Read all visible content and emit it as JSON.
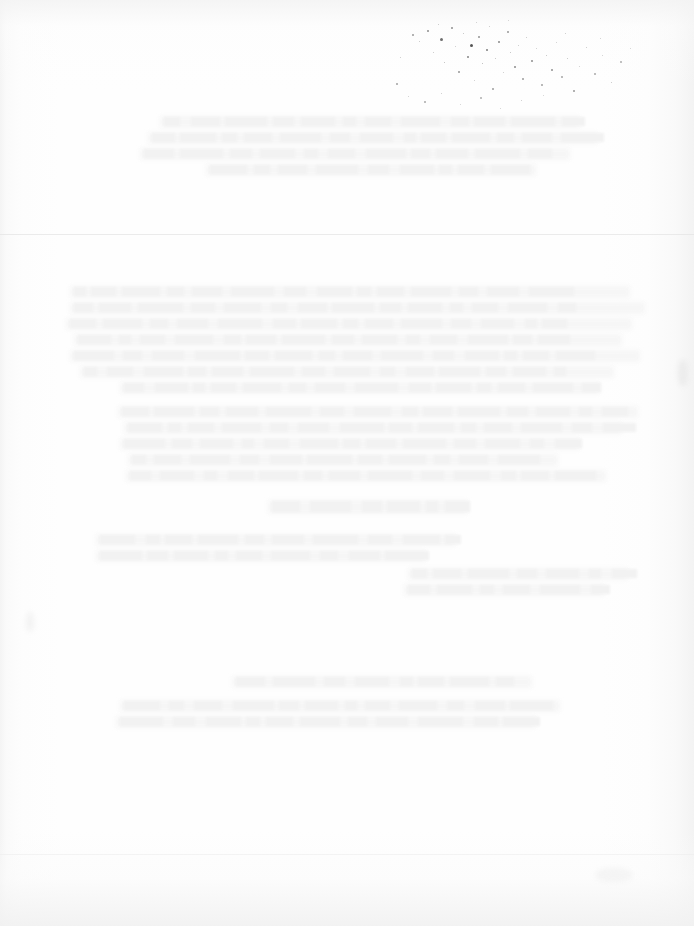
{
  "document": {
    "kind": "scanned-page",
    "page_state": "blank",
    "visible_text": "",
    "width_px": 694,
    "height_px": 926,
    "notes_visible_on_page": "No legible text, headings, figures, tables or UI controls are rendered on this page."
  },
  "appearance": {
    "paper_color": "#fefefe",
    "paper_edge_shadow_color": "#f3f3f3",
    "ghost_text_color": "#f5f5f5",
    "speck_color_dark": "#555555",
    "speck_color_mid": "#888888",
    "speck_color_light": "#bbbbbb",
    "seam_color": "#e4e4e4"
  },
  "artifacts": {
    "speck_cluster_label": "toner-speckle-cluster",
    "ghost_text_label": "bleed-through-ghost-text",
    "seam_label": "scan-seam-line",
    "gutter_label": "scan-gutter-shading"
  },
  "specks": [
    {
      "x": 412,
      "y": 34,
      "d": 2,
      "c": "#9a9a9a"
    },
    {
      "x": 419,
      "y": 41,
      "d": 1,
      "c": "#bdbdbd"
    },
    {
      "x": 427,
      "y": 30,
      "d": 2,
      "c": "#8c8c8c"
    },
    {
      "x": 433,
      "y": 52,
      "d": 1,
      "c": "#c0c0c0"
    },
    {
      "x": 440,
      "y": 38,
      "d": 3,
      "c": "#6f6f6f"
    },
    {
      "x": 444,
      "y": 62,
      "d": 1,
      "c": "#b4b4b4"
    },
    {
      "x": 451,
      "y": 27,
      "d": 2,
      "c": "#8f8f8f"
    },
    {
      "x": 455,
      "y": 46,
      "d": 1,
      "c": "#c3c3c3"
    },
    {
      "x": 458,
      "y": 71,
      "d": 2,
      "c": "#969696"
    },
    {
      "x": 463,
      "y": 33,
      "d": 1,
      "c": "#b9b9b9"
    },
    {
      "x": 467,
      "y": 56,
      "d": 2,
      "c": "#858585"
    },
    {
      "x": 470,
      "y": 44,
      "d": 3,
      "c": "#555555"
    },
    {
      "x": 474,
      "y": 80,
      "d": 1,
      "c": "#c6c6c6"
    },
    {
      "x": 478,
      "y": 36,
      "d": 2,
      "c": "#929292"
    },
    {
      "x": 482,
      "y": 63,
      "d": 1,
      "c": "#b0b0b0"
    },
    {
      "x": 486,
      "y": 49,
      "d": 2,
      "c": "#7d7d7d"
    },
    {
      "x": 489,
      "y": 26,
      "d": 1,
      "c": "#c1c1c1"
    },
    {
      "x": 492,
      "y": 88,
      "d": 2,
      "c": "#9d9d9d"
    },
    {
      "x": 495,
      "y": 58,
      "d": 1,
      "c": "#bbbbbb"
    },
    {
      "x": 498,
      "y": 41,
      "d": 2,
      "c": "#888888"
    },
    {
      "x": 503,
      "y": 72,
      "d": 1,
      "c": "#c4c4c4"
    },
    {
      "x": 507,
      "y": 31,
      "d": 2,
      "c": "#979797"
    },
    {
      "x": 510,
      "y": 52,
      "d": 1,
      "c": "#b6b6b6"
    },
    {
      "x": 514,
      "y": 66,
      "d": 2,
      "c": "#8b8b8b"
    },
    {
      "x": 518,
      "y": 45,
      "d": 1,
      "c": "#c2c2c2"
    },
    {
      "x": 522,
      "y": 78,
      "d": 2,
      "c": "#9b9b9b"
    },
    {
      "x": 526,
      "y": 37,
      "d": 1,
      "c": "#bfbfbf"
    },
    {
      "x": 531,
      "y": 60,
      "d": 2,
      "c": "#8e8e8e"
    },
    {
      "x": 536,
      "y": 48,
      "d": 1,
      "c": "#c5c5c5"
    },
    {
      "x": 541,
      "y": 84,
      "d": 2,
      "c": "#a2a2a2"
    },
    {
      "x": 546,
      "y": 55,
      "d": 1,
      "c": "#bababa"
    },
    {
      "x": 551,
      "y": 69,
      "d": 2,
      "c": "#909090"
    },
    {
      "x": 556,
      "y": 42,
      "d": 1,
      "c": "#c7c7c7"
    },
    {
      "x": 561,
      "y": 76,
      "d": 2,
      "c": "#a5a5a5"
    },
    {
      "x": 567,
      "y": 58,
      "d": 1,
      "c": "#bcbcbc"
    },
    {
      "x": 573,
      "y": 90,
      "d": 2,
      "c": "#999999"
    },
    {
      "x": 579,
      "y": 66,
      "d": 1,
      "c": "#c8c8c8"
    },
    {
      "x": 586,
      "y": 47,
      "d": 1,
      "c": "#c0c0c0"
    },
    {
      "x": 594,
      "y": 73,
      "d": 2,
      "c": "#a8a8a8"
    },
    {
      "x": 602,
      "y": 55,
      "d": 1,
      "c": "#c9c9c9"
    },
    {
      "x": 611,
      "y": 82,
      "d": 1,
      "c": "#bebebe"
    },
    {
      "x": 620,
      "y": 61,
      "d": 2,
      "c": "#acacac"
    },
    {
      "x": 630,
      "y": 48,
      "d": 1,
      "c": "#cacaca"
    },
    {
      "x": 400,
      "y": 57,
      "d": 1,
      "c": "#c2c2c2"
    },
    {
      "x": 396,
      "y": 83,
      "d": 2,
      "c": "#a0a0a0"
    },
    {
      "x": 408,
      "y": 96,
      "d": 1,
      "c": "#c6c6c6"
    },
    {
      "x": 424,
      "y": 101,
      "d": 2,
      "c": "#a9a9a9"
    },
    {
      "x": 441,
      "y": 93,
      "d": 1,
      "c": "#c4c4c4"
    },
    {
      "x": 460,
      "y": 104,
      "d": 1,
      "c": "#cbcbcb"
    },
    {
      "x": 480,
      "y": 97,
      "d": 2,
      "c": "#aeaeae"
    },
    {
      "x": 500,
      "y": 108,
      "d": 1,
      "c": "#cccccc"
    },
    {
      "x": 521,
      "y": 100,
      "d": 1,
      "c": "#c3c3c3"
    },
    {
      "x": 543,
      "y": 95,
      "d": 1,
      "c": "#cdcdcd"
    },
    {
      "x": 438,
      "y": 24,
      "d": 1,
      "c": "#bdbdbd"
    },
    {
      "x": 476,
      "y": 22,
      "d": 1,
      "c": "#c5c5c5"
    },
    {
      "x": 508,
      "y": 20,
      "d": 1,
      "c": "#c9c9c9"
    },
    {
      "x": 600,
      "y": 38,
      "d": 1,
      "c": "#c7c7c7"
    },
    {
      "x": 565,
      "y": 33,
      "d": 1,
      "c": "#c1c1c1"
    }
  ],
  "ghost_bands": [
    {
      "x": 70,
      "y": 286,
      "w": 560,
      "h": 12
    },
    {
      "x": 70,
      "y": 302,
      "w": 575,
      "h": 12
    },
    {
      "x": 66,
      "y": 318,
      "w": 566,
      "h": 12
    },
    {
      "x": 74,
      "y": 334,
      "w": 548,
      "h": 12
    },
    {
      "x": 70,
      "y": 350,
      "w": 570,
      "h": 12
    },
    {
      "x": 80,
      "y": 366,
      "w": 534,
      "h": 12
    },
    {
      "x": 120,
      "y": 382,
      "w": 480,
      "h": 12
    },
    {
      "x": 118,
      "y": 406,
      "w": 520,
      "h": 12
    },
    {
      "x": 124,
      "y": 422,
      "w": 498,
      "h": 12
    },
    {
      "x": 120,
      "y": 438,
      "w": 460,
      "h": 12
    },
    {
      "x": 128,
      "y": 454,
      "w": 430,
      "h": 12
    },
    {
      "x": 126,
      "y": 470,
      "w": 480,
      "h": 12
    },
    {
      "x": 268,
      "y": 500,
      "w": 200,
      "h": 14
    },
    {
      "x": 96,
      "y": 534,
      "w": 360,
      "h": 12
    },
    {
      "x": 96,
      "y": 550,
      "w": 330,
      "h": 12
    },
    {
      "x": 408,
      "y": 568,
      "w": 220,
      "h": 12
    },
    {
      "x": 404,
      "y": 584,
      "w": 200,
      "h": 12
    },
    {
      "x": 232,
      "y": 676,
      "w": 300,
      "h": 12
    },
    {
      "x": 120,
      "y": 700,
      "w": 440,
      "h": 12
    },
    {
      "x": 116,
      "y": 716,
      "w": 420,
      "h": 12
    },
    {
      "x": 160,
      "y": 116,
      "w": 420,
      "h": 12
    },
    {
      "x": 148,
      "y": 132,
      "w": 450,
      "h": 12
    },
    {
      "x": 140,
      "y": 148,
      "w": 430,
      "h": 12
    },
    {
      "x": 206,
      "y": 164,
      "w": 330,
      "h": 12
    }
  ],
  "smudges": [
    {
      "x": 678,
      "y": 360,
      "w": 10,
      "h": 26,
      "c": "rgba(232,232,232,0.75)"
    },
    {
      "x": 596,
      "y": 868,
      "w": 36,
      "h": 14,
      "c": "rgba(242,242,242,0.8)"
    },
    {
      "x": 26,
      "y": 612,
      "w": 8,
      "h": 20,
      "c": "rgba(240,240,240,0.7)"
    }
  ]
}
